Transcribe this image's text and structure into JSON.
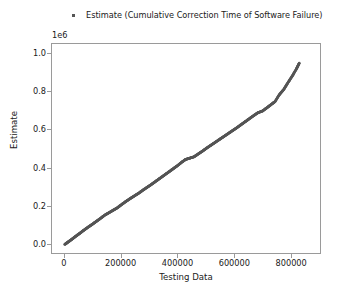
{
  "figure": {
    "width": 337,
    "height": 293,
    "background": "#ffffff"
  },
  "legend": {
    "label": "Estimate (Cumulative Correction Time of Software Failure)",
    "marker": "square-point-marker",
    "marker_color": "#555555",
    "position": "upper-center-above-axes"
  },
  "axes": {
    "offset_text": "1e6",
    "frame_color": "#9a9a9a"
  },
  "chart_data": {
    "type": "scatter",
    "title": "",
    "subtitle": "",
    "xlabel": "Testing Data",
    "ylabel": "Estimate",
    "xlim": [
      -45000,
      905000
    ],
    "ylim": [
      -0.05,
      1.05
    ],
    "y_offset_multiplier": "1e6",
    "grid": false,
    "legend_position": "above-axes",
    "xticks": [
      0,
      200000,
      400000,
      600000,
      800000
    ],
    "xtick_labels": [
      "0",
      "200000",
      "400000",
      "600000",
      "800000"
    ],
    "yticks": [
      0.0,
      0.2,
      0.4,
      0.6,
      0.8,
      1.0
    ],
    "ytick_labels": [
      "0.0",
      "0.2",
      "0.4",
      "0.6",
      "0.8",
      "1.0"
    ],
    "series": [
      {
        "name": "Estimate (Cumulative Correction Time of Software Failure)",
        "color": "#555555",
        "marker": "point",
        "x": [
          0,
          12000,
          25000,
          38000,
          52000,
          66000,
          80000,
          95000,
          110000,
          125000,
          140000,
          155000,
          170000,
          185000,
          200000,
          215000,
          230000,
          245000,
          260000,
          275000,
          290000,
          305000,
          320000,
          335000,
          350000,
          365000,
          380000,
          395000,
          410000,
          425000,
          440000,
          455000,
          470000,
          485000,
          500000,
          515000,
          530000,
          545000,
          560000,
          575000,
          590000,
          605000,
          620000,
          635000,
          650000,
          665000,
          680000,
          695000,
          710000,
          725000,
          740000,
          755000,
          770000,
          785000,
          800000,
          815000,
          825000
        ],
        "y": [
          0.005,
          0.018,
          0.032,
          0.047,
          0.062,
          0.078,
          0.093,
          0.108,
          0.124,
          0.14,
          0.157,
          0.17,
          0.183,
          0.196,
          0.213,
          0.229,
          0.244,
          0.258,
          0.272,
          0.288,
          0.303,
          0.318,
          0.334,
          0.35,
          0.366,
          0.382,
          0.398,
          0.414,
          0.432,
          0.448,
          0.455,
          0.462,
          0.477,
          0.492,
          0.508,
          0.523,
          0.538,
          0.553,
          0.568,
          0.583,
          0.598,
          0.613,
          0.629,
          0.645,
          0.661,
          0.677,
          0.692,
          0.7,
          0.716,
          0.733,
          0.75,
          0.786,
          0.812,
          0.848,
          0.882,
          0.92,
          0.95
        ]
      }
    ]
  }
}
